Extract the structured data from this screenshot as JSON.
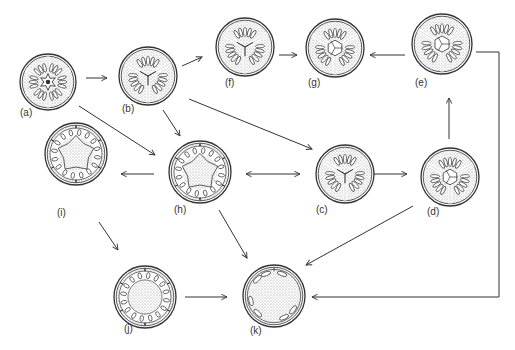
{
  "diagram": {
    "type": "flow-of-cross-sections",
    "colors": {
      "line": "#333333",
      "stipple": "#bdbdbd",
      "background": "#ffffff",
      "locule": "#ffffff"
    },
    "nodes": [
      {
        "id": "a",
        "label": "(a)",
        "cx": 48,
        "cy": 82,
        "r": 28,
        "segments": 6,
        "center": "star",
        "locule_style": "radial",
        "label_x": 20,
        "label_y": 108
      },
      {
        "id": "b",
        "label": "(b)",
        "cx": 148,
        "cy": 76,
        "r": 29,
        "segments": 3,
        "center": "y-axis",
        "locule_style": "radial",
        "label_x": 122,
        "label_y": 104
      },
      {
        "id": "f",
        "label": "(f)",
        "cx": 245,
        "cy": 47,
        "r": 29,
        "segments": 3,
        "center": "y-axis",
        "locule_style": "radial",
        "label_x": 225,
        "label_y": 78
      },
      {
        "id": "g",
        "label": "(g)",
        "cx": 335,
        "cy": 48,
        "r": 29,
        "segments": 3,
        "center": "hexagon",
        "locule_style": "radial",
        "label_x": 308,
        "label_y": 78
      },
      {
        "id": "e",
        "label": "(e)",
        "cx": 442,
        "cy": 44,
        "r": 30,
        "segments": 3,
        "center": "hexagon",
        "locule_style": "radial",
        "label_x": 415,
        "label_y": 78
      },
      {
        "id": "h",
        "label": "(h)",
        "cx": 200,
        "cy": 172,
        "r": 31,
        "segments": 6,
        "center": "large-star",
        "locule_style": "ring",
        "label_x": 174,
        "label_y": 205
      },
      {
        "id": "c",
        "label": "(c)",
        "cx": 345,
        "cy": 174,
        "r": 29,
        "segments": 3,
        "center": "y-axis",
        "locule_style": "radial",
        "label_x": 316,
        "label_y": 205
      },
      {
        "id": "d",
        "label": "(d)",
        "cx": 450,
        "cy": 177,
        "r": 29,
        "segments": 3,
        "center": "hexagon",
        "locule_style": "radial",
        "label_x": 427,
        "label_y": 207
      },
      {
        "id": "i",
        "label": "(i)",
        "cx": 76,
        "cy": 154,
        "r": 31,
        "segments": 6,
        "center": "large-star",
        "locule_style": "ring",
        "label_x": 57,
        "label_y": 208
      },
      {
        "id": "j",
        "label": "(j)",
        "cx": 145,
        "cy": 297,
        "r": 31,
        "segments": 6,
        "center": "open",
        "locule_style": "ring",
        "label_x": 124,
        "label_y": 324
      },
      {
        "id": "k",
        "label": "(k)",
        "cx": 274,
        "cy": 296,
        "r": 31,
        "segments": 6,
        "center": "open",
        "locule_style": "sparse",
        "label_x": 250,
        "label_y": 326
      }
    ],
    "edges": [
      {
        "from": "a",
        "to": "b",
        "points": [
          [
            86,
            78
          ],
          [
            107,
            78
          ]
        ],
        "head": "end"
      },
      {
        "from": "b",
        "to": "f",
        "points": [
          [
            182,
            66
          ],
          [
            202,
            57
          ]
        ],
        "head": "end"
      },
      {
        "from": "f",
        "to": "g",
        "points": [
          [
            279,
            55
          ],
          [
            297,
            55
          ]
        ],
        "head": "end"
      },
      {
        "from": "e",
        "to": "g",
        "points": [
          [
            405,
            55
          ],
          [
            370,
            55
          ]
        ],
        "head": "end"
      },
      {
        "from": "a",
        "to": "h",
        "points": [
          [
            79,
            106
          ],
          [
            155,
            155
          ]
        ],
        "head": "end"
      },
      {
        "from": "b",
        "to": "h",
        "points": [
          [
            163,
            110
          ],
          [
            180,
            136
          ]
        ],
        "head": "end"
      },
      {
        "from": "b",
        "to": "c",
        "points": [
          [
            189,
            99
          ],
          [
            312,
            149
          ]
        ],
        "head": "end"
      },
      {
        "from": "h",
        "to": "c",
        "points": [
          [
            246,
            174
          ],
          [
            300,
            174
          ]
        ],
        "head": "both"
      },
      {
        "from": "c",
        "to": "d",
        "points": [
          [
            372,
            174
          ],
          [
            407,
            174
          ]
        ],
        "head": "end"
      },
      {
        "from": "d",
        "to": "e",
        "points": [
          [
            449,
            139
          ],
          [
            449,
            98
          ]
        ],
        "head": "end"
      },
      {
        "from": "h",
        "to": "i",
        "points": [
          [
            154,
            174
          ],
          [
            121,
            174
          ]
        ],
        "head": "end"
      },
      {
        "from": "i",
        "to": "j",
        "points": [
          [
            99,
            222
          ],
          [
            118,
            250
          ]
        ],
        "head": "end"
      },
      {
        "from": "j",
        "to": "k",
        "points": [
          [
            185,
            297
          ],
          [
            227,
            297
          ]
        ],
        "head": "end"
      },
      {
        "from": "h",
        "to": "k",
        "points": [
          [
            219,
            210
          ],
          [
            247,
            258
          ]
        ],
        "head": "end"
      },
      {
        "from": "d",
        "to": "k",
        "points": [
          [
            413,
            206
          ],
          [
            306,
            265
          ]
        ],
        "head": "end"
      },
      {
        "from": "e",
        "to": "k",
        "points": [
          [
            476,
            52
          ],
          [
            499,
            52
          ],
          [
            499,
            297
          ],
          [
            312,
            297
          ]
        ],
        "head": "end"
      }
    ]
  }
}
